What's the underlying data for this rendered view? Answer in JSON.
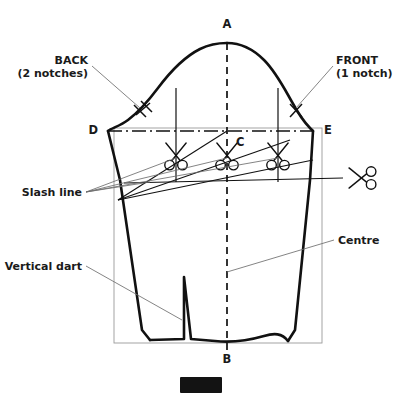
{
  "figure": {
    "background_color": "#ffffff",
    "ink_color": "#111111",
    "leader_color": "#6e6e6e",
    "frame_color": "#9a9a9a"
  },
  "points": {
    "a": "A",
    "b": "B",
    "c": "C",
    "d": "D",
    "e": "E"
  },
  "annotations": {
    "back": {
      "line1": "BACK",
      "line2": "(2 notches)"
    },
    "front": {
      "line1": "FRONT",
      "line2": "(1 notch)"
    },
    "slash_line": "Slash line",
    "vertical_dart": "Vertical dart",
    "centre": "Centre"
  },
  "icons": {
    "scissors_count": 4,
    "scissors_names": [
      "scissors-icon-back",
      "scissors-icon-centre",
      "scissors-icon-front",
      "scissors-icon-side"
    ],
    "notch_back": "double-notch-mark",
    "notch_front": "single-notch-mark"
  },
  "caption": {
    "badge_present": true
  }
}
